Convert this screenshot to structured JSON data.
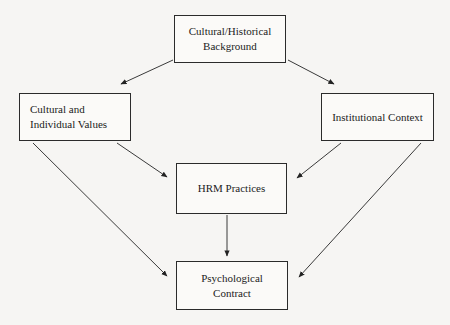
{
  "diagram": {
    "background_color": "#f6f5f3",
    "line_color": "#2b2b2b",
    "box_fill_color": "#fbfaf8",
    "nodes": [
      {
        "id": "cultural-historical-background",
        "label": "Cultural/Historical\nBackground",
        "align": "center"
      },
      {
        "id": "cultural-individual-values",
        "label": "Cultural and\nIndividual Values",
        "align": "left"
      },
      {
        "id": "institutional-context",
        "label": "Institutional Context",
        "align": "center"
      },
      {
        "id": "hrm-practices",
        "label": "HRM Practices",
        "align": "center"
      },
      {
        "id": "psychological-contract",
        "label": "Psychological\nContract",
        "align": "center"
      }
    ],
    "edges": [
      {
        "id": "background-to-values",
        "from": "cultural-historical-background",
        "to": "cultural-individual-values"
      },
      {
        "id": "background-to-institutional",
        "from": "cultural-historical-background",
        "to": "institutional-context"
      },
      {
        "id": "values-to-hrm",
        "from": "cultural-individual-values",
        "to": "hrm-practices"
      },
      {
        "id": "institutional-to-hrm",
        "from": "institutional-context",
        "to": "hrm-practices"
      },
      {
        "id": "hrm-to-contract",
        "from": "hrm-practices",
        "to": "psychological-contract"
      },
      {
        "id": "values-to-contract",
        "from": "cultural-individual-values",
        "to": "psychological-contract"
      },
      {
        "id": "institutional-to-contract",
        "from": "institutional-context",
        "to": "psychological-contract"
      }
    ]
  }
}
